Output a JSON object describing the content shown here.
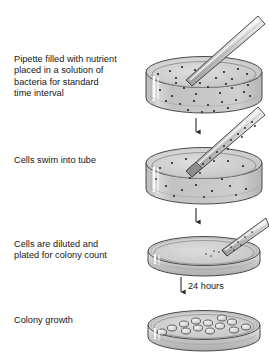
{
  "figure": {
    "background_color": "#ffffff",
    "width": 269,
    "height": 360
  },
  "palette": {
    "outline": "#3d3d3d",
    "glass_light": "#e8e8e8",
    "glass_mid": "#c9c9c9",
    "glass_dark": "#a8a8a8",
    "medium_fill": "#c4c4c4",
    "medium_fill_top": "#d2d2d2",
    "bacteria_dot": "#2a2a2a",
    "colony_fill": "#dcdcdc",
    "colony_outline": "#4a4a4a",
    "highlight_white": "#ffffff",
    "text": "#151515",
    "arrow": "#2a2a2a"
  },
  "steps": [
    {
      "id": "step-1",
      "caption": "Pipette filled with nutrient\nplaced in a solution of\nbacteria for standard\ntime interval",
      "vessel": "deep-dish-with-bacteria",
      "pipette": "empty-pipette",
      "bacteria_count": 46
    },
    {
      "id": "step-2",
      "caption": "Cells swim into tube",
      "vessel": "deep-dish-with-bacteria",
      "pipette": "pipette-with-cells",
      "bacteria_count": 18
    },
    {
      "id": "step-3",
      "caption": "Cells are diluted and\nplated for colony count",
      "vessel": "flat-petri-plate",
      "pipette": "pipette-dispensing",
      "bacteria_count": 5
    },
    {
      "id": "step-4",
      "caption": "Colony growth",
      "vessel": "flat-petri-plate-with-colonies",
      "pipette": "none",
      "colony_count": 13
    }
  ],
  "arrows": [
    {
      "id": "arrow-1",
      "label": ""
    },
    {
      "id": "arrow-2",
      "label": ""
    },
    {
      "id": "arrow-3",
      "label": "24 hours"
    }
  ],
  "annotations": {
    "incubation_time": "24 hours"
  }
}
